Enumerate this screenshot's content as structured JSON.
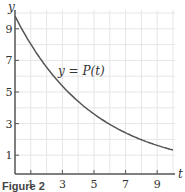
{
  "chart_data": {
    "type": "line",
    "title": "",
    "xlabel": "t",
    "ylabel": "y",
    "xlim": [
      0,
      10
    ],
    "ylim": [
      0,
      10
    ],
    "grid": true,
    "x_ticks": [
      1,
      3,
      5,
      7,
      9
    ],
    "y_ticks": [
      1,
      3,
      5,
      7,
      9
    ],
    "series": [
      {
        "name": "y = P(t)",
        "x": [
          0,
          1,
          2,
          3,
          4,
          5,
          6,
          7,
          8,
          9,
          10
        ],
        "values": [
          9.8,
          8.0,
          6.6,
          5.4,
          4.4,
          3.6,
          3.0,
          2.4,
          2.0,
          1.6,
          1.3
        ]
      }
    ],
    "annotations": [
      "y = P(t)"
    ]
  },
  "labels": {
    "x_axis": "t",
    "y_axis": "y",
    "curve": "y = P(t)",
    "x_ticks": [
      "1",
      "3",
      "5",
      "7",
      "9"
    ],
    "y_ticks": [
      "9",
      "7",
      "5",
      "3",
      "1"
    ],
    "caption": "Figure 2"
  }
}
